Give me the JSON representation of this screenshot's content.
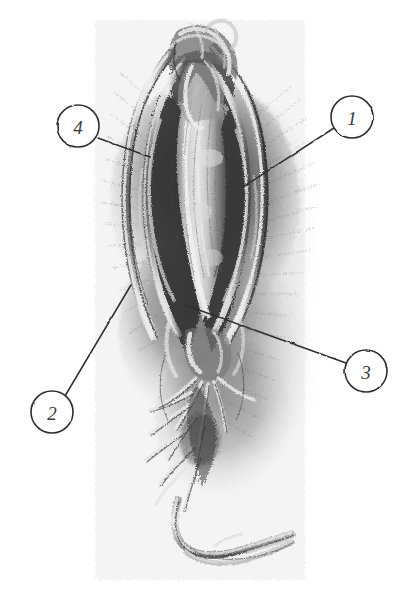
{
  "figure": {
    "background_color": "#ffffff",
    "ink_color": "#3a3a3a",
    "graphite_color": "#4a4a4a",
    "width": 416,
    "height": 590
  },
  "callouts": [
    {
      "id": "callout-1",
      "label": "1",
      "circle": {
        "cx": 352,
        "cy": 117,
        "r": 21
      },
      "leader": {
        "x1": 334,
        "y1": 128,
        "x2": 243,
        "y2": 187
      }
    },
    {
      "id": "callout-2",
      "label": "2",
      "circle": {
        "cx": 52,
        "cy": 412,
        "r": 21
      },
      "leader": {
        "x1": 65,
        "y1": 396,
        "x2": 131,
        "y2": 285
      }
    },
    {
      "id": "callout-3",
      "label": "3",
      "circle": {
        "cx": 366,
        "cy": 371,
        "r": 21
      },
      "leader": {
        "x1": 346,
        "y1": 363,
        "x2": 185,
        "y2": 305
      }
    },
    {
      "id": "callout-4",
      "label": "4",
      "circle": {
        "cx": 78,
        "cy": 126,
        "r": 21
      },
      "leader": {
        "x1": 98,
        "y1": 138,
        "x2": 150,
        "y2": 157
      }
    }
  ],
  "specimen": {
    "name": "root-specimen",
    "description": "Hand-drawn graphite rendering of a gnarled, fibrous taproot with twisted rootlets and a long trailing rootlet at the base",
    "bounds": {
      "x": 95,
      "y": 22,
      "width": 205,
      "height": 555
    }
  }
}
